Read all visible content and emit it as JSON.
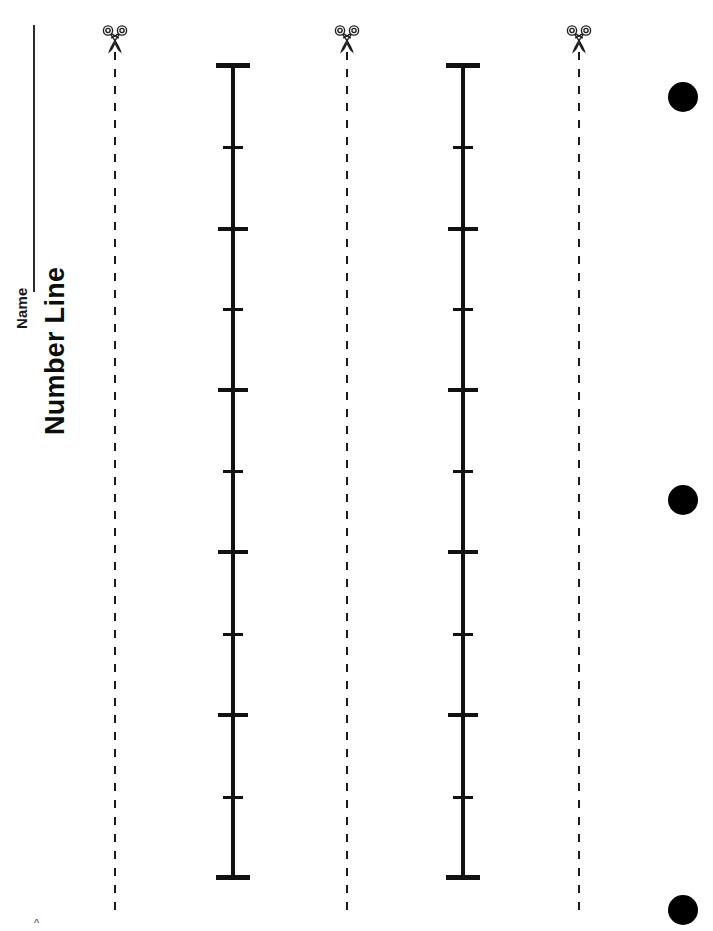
{
  "page": {
    "width": 713,
    "height": 931,
    "background_color": "#ffffff",
    "ink_color": "#111111",
    "type": "worksheet"
  },
  "header": {
    "name_field_label": "Name",
    "title": "Number Line"
  },
  "cut_guides": [
    {
      "id": "cut-guide-1",
      "x": 114,
      "icon": "scissors-icon",
      "style": "dashed"
    },
    {
      "id": "cut-guide-2",
      "x": 346,
      "icon": "scissors-icon",
      "style": "dashed"
    },
    {
      "id": "cut-guide-3",
      "x": 578,
      "icon": "scissors-icon",
      "style": "dashed"
    }
  ],
  "number_lines": [
    {
      "id": "number-line-1",
      "x": 233,
      "top": 64,
      "bottom": 880,
      "orientation": "vertical",
      "tick_count": 11,
      "major_tick_count": 7,
      "minor_tick_count": 4,
      "ticks": [
        {
          "y": 65,
          "kind": "endpoint"
        },
        {
          "y": 147,
          "kind": "minor"
        },
        {
          "y": 229,
          "kind": "major"
        },
        {
          "y": 309,
          "kind": "minor"
        },
        {
          "y": 390,
          "kind": "major"
        },
        {
          "y": 471,
          "kind": "minor"
        },
        {
          "y": 552,
          "kind": "major"
        },
        {
          "y": 634,
          "kind": "minor"
        },
        {
          "y": 715,
          "kind": "major"
        },
        {
          "y": 797,
          "kind": "minor"
        },
        {
          "y": 877,
          "kind": "endpoint"
        }
      ]
    },
    {
      "id": "number-line-2",
      "x": 463,
      "top": 64,
      "bottom": 880,
      "orientation": "vertical",
      "tick_count": 11,
      "major_tick_count": 7,
      "minor_tick_count": 4,
      "ticks": [
        {
          "y": 65,
          "kind": "endpoint"
        },
        {
          "y": 147,
          "kind": "minor"
        },
        {
          "y": 229,
          "kind": "major"
        },
        {
          "y": 309,
          "kind": "minor"
        },
        {
          "y": 390,
          "kind": "major"
        },
        {
          "y": 471,
          "kind": "minor"
        },
        {
          "y": 552,
          "kind": "major"
        },
        {
          "y": 634,
          "kind": "minor"
        },
        {
          "y": 715,
          "kind": "major"
        },
        {
          "y": 797,
          "kind": "minor"
        },
        {
          "y": 877,
          "kind": "endpoint"
        }
      ]
    }
  ],
  "punch_holes": [
    {
      "id": "punch-hole-1",
      "x": 683,
      "y": 97
    },
    {
      "id": "punch-hole-2",
      "x": 683,
      "y": 500
    },
    {
      "id": "punch-hole-3",
      "x": 683,
      "y": 910
    }
  ],
  "corner_mark": {
    "glyph": "^"
  }
}
